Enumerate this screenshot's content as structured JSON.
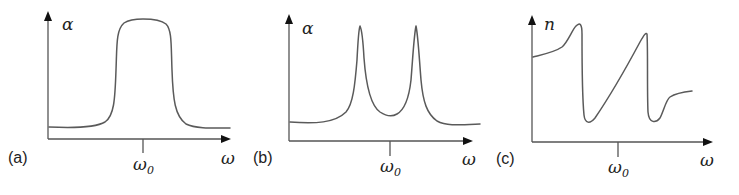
{
  "figure": {
    "panels": [
      {
        "id": "a",
        "label": "(a)",
        "y_axis_label": "α",
        "x_axis_label": "ω",
        "tick_label_main": "ω",
        "tick_label_sub": "0",
        "description": "Broad single absorption band (flat-topped) centered at ω0"
      },
      {
        "id": "b",
        "label": "(b)",
        "y_axis_label": "α",
        "x_axis_label": "ω",
        "tick_label_main": "ω",
        "tick_label_sub": "0",
        "description": "Split absorption: two sharp peaks symmetric about ω0 with a dip at ω0"
      },
      {
        "id": "c",
        "label": "(c)",
        "y_axis_label": "n",
        "x_axis_label": "ω",
        "tick_label_main": "ω",
        "tick_label_sub": "0",
        "description": "Refractive index with two anomalous-dispersion features, steep normal-dispersion slope across ω0"
      }
    ],
    "colors": {
      "curve": "#5a5a5a",
      "axis": "#555555",
      "arrowhead": "#111111",
      "text": "#222222",
      "background": "#ffffff"
    }
  }
}
